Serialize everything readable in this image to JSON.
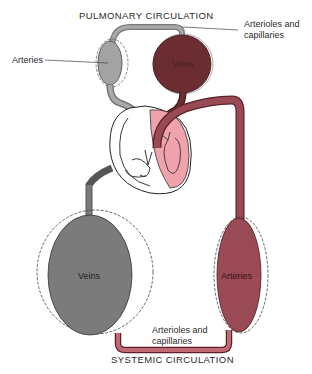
{
  "diagram": {
    "type": "circulatory-system-schematic",
    "titles": {
      "pulmonary": "PULMONARY CIRCULATION",
      "systemic": "SYSTEMIC CIRCULATION"
    },
    "labels": {
      "pulmonary_arteries": "Arteries",
      "pulmonary_veins": "Veins",
      "pulmonary_capillaries_line1": "Arterioles and",
      "pulmonary_capillaries_line2": "capillaries",
      "systemic_veins": "Veins",
      "systemic_arteries": "Arteries",
      "systemic_capillaries_line1": "Arterioles and",
      "systemic_capillaries_line2": "capillaries"
    },
    "colors": {
      "venous_gray": "#8f8f8f",
      "venous_dark_gray": "#6e6e6e",
      "arterial_maroon": "#9a4a55",
      "pulmonary_vein_dark": "#6b2a2e",
      "heart_pink": "#f0a0a8",
      "outline": "#222222"
    }
  }
}
